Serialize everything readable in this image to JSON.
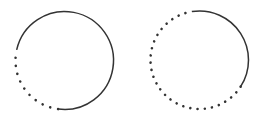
{
  "diagram": {
    "background": "#ffffff",
    "stroke_color": "#333333",
    "circles": [
      {
        "id": "left",
        "cx": 64.5,
        "cy": 60.5,
        "r": 49,
        "solid_start_deg": 192.5,
        "solid_end_deg": 457.5,
        "dot_spacing": 8.2
      },
      {
        "id": "right",
        "cx": 199.5,
        "cy": 60,
        "r": 49,
        "solid_start_deg": 261,
        "solid_end_deg": 393,
        "dot_spacing": 7.1
      }
    ]
  }
}
